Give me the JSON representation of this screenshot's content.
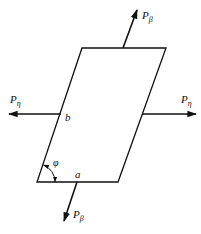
{
  "diagram": {
    "type": "parallelogram-force-diagram",
    "shape": {
      "name": "parallelogram",
      "vertices": [
        [
          82,
          48
        ],
        [
          166,
          48
        ],
        [
          118,
          182
        ],
        [
          37,
          182
        ]
      ],
      "side_labels": {
        "bottom": "a",
        "left": "b"
      },
      "angle_label": "φ"
    },
    "forces": [
      {
        "id": "p-beta-top",
        "symbol": "P",
        "subscript": "β",
        "direction": "up-right",
        "from": [
          123,
          48
        ],
        "to": [
          137,
          10
        ]
      },
      {
        "id": "p-beta-bottom",
        "symbol": "P",
        "subscript": "β",
        "direction": "down-left",
        "from": [
          77,
          182
        ],
        "to": [
          64,
          221
        ]
      },
      {
        "id": "p-eta-left",
        "symbol": "P",
        "subscript": "η",
        "direction": "left",
        "from": [
          61,
          114
        ],
        "to": [
          9,
          114
        ]
      },
      {
        "id": "p-eta-right",
        "symbol": "P",
        "subscript": "η",
        "direction": "right",
        "from": [
          142,
          114
        ],
        "to": [
          196,
          114
        ]
      }
    ],
    "labels": {
      "top_force": {
        "main": "P",
        "sub": "β"
      },
      "bottom_force": {
        "main": "P",
        "sub": "β"
      },
      "left_force": {
        "main": "P",
        "sub": "η"
      },
      "right_force": {
        "main": "P",
        "sub": "η"
      },
      "side_a": "a",
      "side_b": "b",
      "angle": "φ"
    },
    "colors": {
      "stroke": "#111111",
      "background": "#ffffff"
    }
  }
}
